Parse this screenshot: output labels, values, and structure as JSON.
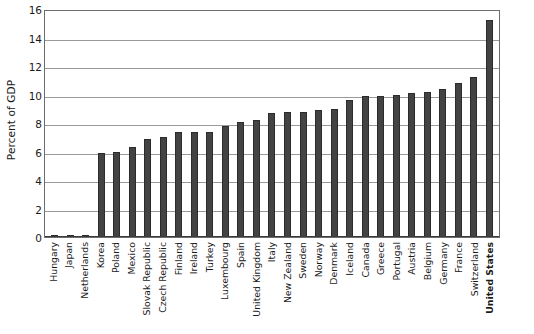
{
  "chart_data": {
    "type": "bar",
    "title": "",
    "subtitle": "",
    "xlabel": "",
    "ylabel": "Percent of GDP",
    "ylim": [
      0,
      16
    ],
    "y_ticks": [
      0,
      2,
      4,
      6,
      8,
      10,
      12,
      14,
      16
    ],
    "grid": true,
    "legend": null,
    "orientation": "vertical",
    "bar_color": "#434343",
    "highlight_category": "United States",
    "categories": [
      "Hungary",
      "Japan",
      "Netherlands",
      "Korea",
      "Poland",
      "Mexico",
      "Slovak Republic",
      "Czech Republic",
      "Finland",
      "Ireland",
      "Turkey",
      "Luxembourg",
      "Spain",
      "United Kingdom",
      "Italy",
      "New Zealand",
      "Sweden",
      "Norway",
      "Denmark",
      "Iceland",
      "Canada",
      "Greece",
      "Portugal",
      "Austria",
      "Belgium",
      "Germany",
      "France",
      "Switzerland",
      "United States"
    ],
    "values": [
      0.1,
      0.1,
      0.1,
      5.9,
      6.0,
      6.3,
      6.9,
      7.0,
      7.4,
      7.4,
      7.4,
      7.8,
      8.1,
      8.2,
      8.7,
      8.8,
      8.8,
      8.9,
      9.0,
      9.6,
      9.9,
      9.9,
      10.0,
      10.1,
      10.2,
      10.4,
      10.8,
      11.2,
      15.2
    ]
  }
}
